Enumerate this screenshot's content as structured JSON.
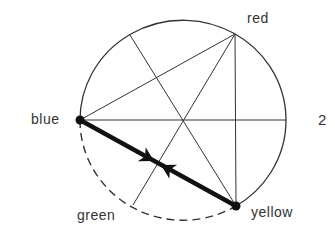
{
  "labels": {
    "blue": "blue",
    "red": "red",
    "yellow": "yellow",
    "green": "green",
    "figure_number": "2"
  },
  "colors": {
    "stroke": "#333333",
    "background": "#ffffff"
  },
  "geometry": {
    "circle": {
      "cx": 183,
      "cy": 120,
      "rx": 103,
      "ry": 100
    },
    "points": {
      "blue": [
        80,
        120
      ],
      "red": [
        235,
        34
      ],
      "yellow": [
        236,
        206
      ],
      "green": [
        133,
        205
      ],
      "top_left": [
        130,
        35
      ],
      "right": [
        286,
        120
      ]
    },
    "arrow_meet": [
      158,
      163
    ]
  }
}
